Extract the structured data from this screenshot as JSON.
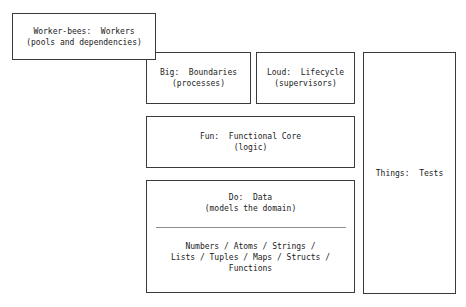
{
  "diagram": {
    "accent_color": "#3a3a3a",
    "background_color": "#ffffff",
    "divider_color": "#8d8d8d",
    "boxes": {
      "workers": {
        "name": "worker-bees",
        "text": "Worker-bees:  Workers\n(pools and dependencies)"
      },
      "big": {
        "name": "big",
        "text": "Big:  Boundaries\n(processes)"
      },
      "loud": {
        "name": "loud",
        "text": "Loud:  Lifecycle\n(supervisors)"
      },
      "fun": {
        "name": "fun",
        "text": "Fun:  Functional Core\n(logic)"
      },
      "do": {
        "name": "do",
        "head_text": "Do:  Data\n(models the domain)",
        "body_text": "Numbers / Atoms / Strings /\nLists / Tuples / Maps / Structs /\nFunctions"
      },
      "things": {
        "name": "things",
        "text": "Things:  Tests"
      }
    }
  }
}
